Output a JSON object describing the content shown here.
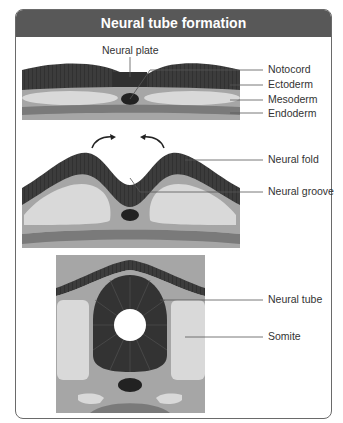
{
  "title": "Neural tube formation",
  "colors": {
    "header": "#585858",
    "ectoderm": "#3c3c3c",
    "mesoderm_outer": "#a6a6a6",
    "mesoderm_inner": "#d9d9d9",
    "endoderm": "#7a7a7a",
    "notochord": "#222222",
    "leader": "#555555"
  },
  "stages": [
    {
      "name": "neural-plate-stage",
      "labels": {
        "neural_plate": "Neural plate",
        "notocord": "Notocord",
        "ectoderm": "Ectoderm",
        "mesoderm": "Mesoderm",
        "endoderm": "Endoderm"
      }
    },
    {
      "name": "neural-fold-stage",
      "labels": {
        "neural_fold": "Neural fold",
        "neural_groove": "Neural groove"
      }
    },
    {
      "name": "neural-tube-stage",
      "labels": {
        "neural_tube": "Neural tube",
        "somite": "Somite"
      }
    }
  ]
}
